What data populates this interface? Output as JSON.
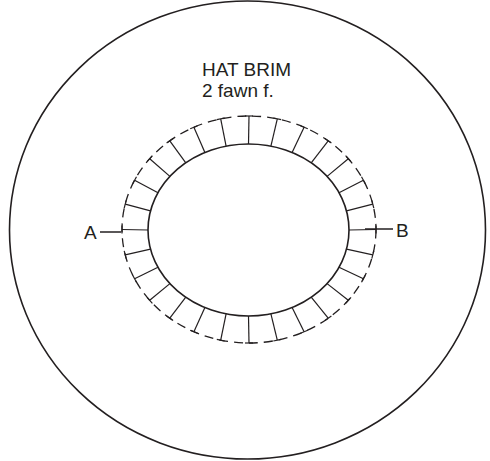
{
  "pattern": {
    "title": "HAT BRIM",
    "subtitle": "2 fawn f.",
    "marker_a": "A",
    "marker_b": "B",
    "stroke_color": "#231f20",
    "background": "#ffffff",
    "outer_circle": {
      "cx": 247.5,
      "cy": 230,
      "rx": 238,
      "ry": 229
    },
    "inner_opening": {
      "cx": 248.5,
      "cy": 230,
      "rx": 100.5,
      "ry": 86
    },
    "seam_allowance": {
      "cx": 249,
      "cy": 229.5,
      "rx": 127,
      "ry": 113.5
    },
    "tab_count": 28
  }
}
